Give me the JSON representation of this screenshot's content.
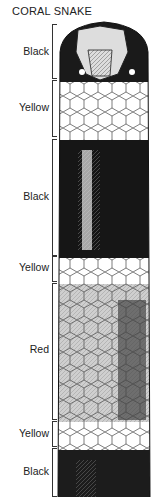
{
  "title": "CORAL SNAKE",
  "bands": [
    {
      "label": "Black",
      "color": "#111111",
      "top": 24,
      "bottom": 79,
      "label_y": 45
    },
    {
      "label": "Yellow",
      "color": "#ffffff",
      "top": 80,
      "bottom": 137,
      "label_y": 101
    },
    {
      "label": "Black",
      "color": "#151515",
      "top": 139,
      "bottom": 256,
      "label_y": 190
    },
    {
      "label": "Yellow",
      "color": "#ffffff",
      "top": 256,
      "bottom": 282,
      "label_y": 261
    },
    {
      "label": "Red",
      "color": "#8a8a8a",
      "top": 283,
      "bottom": 420,
      "label_y": 343
    },
    {
      "label": "Yellow",
      "color": "#ffffff",
      "top": 421,
      "bottom": 447,
      "label_y": 427
    },
    {
      "label": "Black",
      "color": "#1a1a1a",
      "top": 448,
      "bottom": 497,
      "label_y": 465
    }
  ]
}
